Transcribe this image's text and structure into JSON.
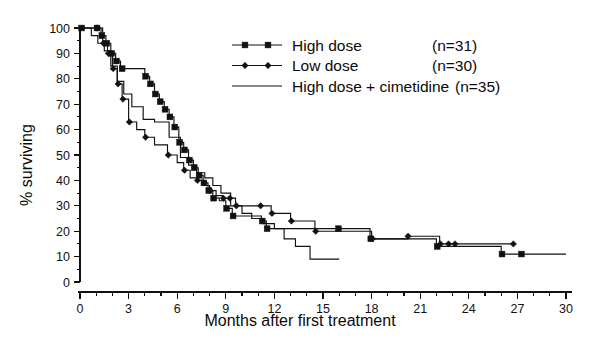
{
  "chart_data": {
    "type": "line",
    "subtype": "kaplan-meier-step",
    "title": "",
    "xlabel": "Months after first treatment",
    "ylabel": "% surviving",
    "xlim": [
      0,
      30
    ],
    "ylim": [
      0,
      100
    ],
    "xticks": [
      0,
      3,
      6,
      9,
      12,
      15,
      18,
      21,
      24,
      27,
      30
    ],
    "xtick_labels": [
      "0",
      "3",
      "6",
      "9",
      "12",
      "15",
      "18",
      "21",
      "24",
      "27",
      "30"
    ],
    "x_minor_tick_step": 1,
    "yticks": [
      0,
      10,
      20,
      30,
      40,
      50,
      60,
      70,
      80,
      90,
      100
    ],
    "ytick_labels": [
      "0",
      "10",
      "20",
      "30",
      "40",
      "50",
      "60",
      "70",
      "80",
      "90",
      "100"
    ],
    "y_minor_tick_step": 5,
    "grid": false,
    "legend_position": "upper-right-inside",
    "series": [
      {
        "name": "High dose",
        "n_label": "(n=31)",
        "n": 31,
        "marker": "square",
        "color": "#111111",
        "x": [
          0,
          1.0,
          1.3,
          1.6,
          1.9,
          2.2,
          2.5,
          4.0,
          4.3,
          4.6,
          4.9,
          5.2,
          5.5,
          5.8,
          6.1,
          6.4,
          6.7,
          7.0,
          7.3,
          7.6,
          7.9,
          8.2,
          8.6,
          9.0,
          9.4,
          10.1,
          11.2,
          11.5,
          12.3,
          13.0,
          15.9,
          17.9,
          22.0,
          22.4,
          26.0,
          27.2,
          30.0
        ],
        "y": [
          100,
          100,
          97,
          94,
          90,
          87,
          84,
          81,
          78,
          74,
          71,
          68,
          65,
          61,
          55,
          52,
          48,
          45,
          42,
          39,
          36,
          33,
          32,
          29,
          26,
          26,
          24,
          21,
          21,
          21,
          21,
          17,
          14,
          14,
          11,
          11,
          11
        ]
      },
      {
        "name": "Low dose",
        "n_label": "(n=30)",
        "n": 30,
        "marker": "diamond",
        "color": "#111111",
        "x": [
          0,
          1.0,
          1.4,
          1.7,
          2.0,
          2.3,
          2.6,
          3.0,
          3.5,
          4.0,
          4.6,
          5.4,
          6.0,
          6.4,
          6.8,
          7.2,
          7.6,
          8.0,
          8.4,
          8.8,
          9.2,
          9.6,
          10.4,
          11.1,
          11.8,
          12.6,
          13.0,
          14.5,
          18.0,
          20.2,
          22.2,
          22.8,
          23.1,
          26.7
        ],
        "y": [
          100,
          100,
          94,
          90,
          84,
          78,
          72,
          63,
          60,
          57,
          54,
          50,
          47,
          44,
          41,
          40,
          38,
          36,
          34,
          33,
          33,
          30,
          30,
          30,
          27,
          27,
          24,
          20,
          17,
          18,
          15,
          15,
          15,
          15
        ]
      },
      {
        "name": "High dose + cimetidine",
        "n_label": "(n=35)",
        "n": 35,
        "marker": "none",
        "color": "#111111",
        "x": [
          0,
          0.7,
          1.1,
          1.5,
          1.9,
          2.3,
          2.7,
          3.2,
          3.9,
          4.6,
          5.5,
          6.2,
          6.7,
          7.2,
          7.7,
          8.2,
          8.7,
          9.3,
          10.0,
          10.6,
          11.3,
          12.0,
          12.6,
          13.3,
          14.2,
          16.0
        ],
        "y": [
          100,
          97,
          94,
          91,
          85,
          79,
          74,
          69,
          64,
          63,
          57,
          49,
          46,
          43,
          41,
          38,
          35,
          30,
          27,
          25,
          23,
          21,
          17,
          14,
          9,
          9
        ]
      }
    ],
    "markers": {
      "High dose": [
        {
          "x": 0.1,
          "y": 100
        },
        {
          "x": 1.05,
          "y": 100
        },
        {
          "x": 1.35,
          "y": 97
        },
        {
          "x": 1.65,
          "y": 94
        },
        {
          "x": 1.95,
          "y": 90
        },
        {
          "x": 2.25,
          "y": 87
        },
        {
          "x": 2.6,
          "y": 84
        },
        {
          "x": 4.05,
          "y": 81
        },
        {
          "x": 4.35,
          "y": 78
        },
        {
          "x": 4.65,
          "y": 74
        },
        {
          "x": 4.95,
          "y": 71
        },
        {
          "x": 5.25,
          "y": 68
        },
        {
          "x": 5.55,
          "y": 65
        },
        {
          "x": 5.85,
          "y": 61
        },
        {
          "x": 6.15,
          "y": 55
        },
        {
          "x": 6.45,
          "y": 52
        },
        {
          "x": 6.75,
          "y": 48
        },
        {
          "x": 7.05,
          "y": 45
        },
        {
          "x": 7.35,
          "y": 42
        },
        {
          "x": 7.65,
          "y": 39
        },
        {
          "x": 7.95,
          "y": 36
        },
        {
          "x": 8.25,
          "y": 33
        },
        {
          "x": 9.05,
          "y": 29
        },
        {
          "x": 9.45,
          "y": 26
        },
        {
          "x": 11.25,
          "y": 24
        },
        {
          "x": 11.55,
          "y": 21
        },
        {
          "x": 15.95,
          "y": 21
        },
        {
          "x": 17.95,
          "y": 17
        },
        {
          "x": 22.05,
          "y": 14
        },
        {
          "x": 26.05,
          "y": 11
        },
        {
          "x": 27.25,
          "y": 11
        }
      ],
      "Low dose": [
        {
          "x": 1.05,
          "y": 100
        },
        {
          "x": 1.45,
          "y": 94
        },
        {
          "x": 1.75,
          "y": 90
        },
        {
          "x": 2.05,
          "y": 84
        },
        {
          "x": 2.35,
          "y": 78
        },
        {
          "x": 2.65,
          "y": 72
        },
        {
          "x": 3.05,
          "y": 63
        },
        {
          "x": 4.05,
          "y": 57
        },
        {
          "x": 5.45,
          "y": 50
        },
        {
          "x": 6.45,
          "y": 44
        },
        {
          "x": 7.25,
          "y": 40
        },
        {
          "x": 8.05,
          "y": 36
        },
        {
          "x": 8.85,
          "y": 33
        },
        {
          "x": 9.25,
          "y": 33
        },
        {
          "x": 9.65,
          "y": 30
        },
        {
          "x": 11.15,
          "y": 30
        },
        {
          "x": 11.85,
          "y": 27
        },
        {
          "x": 13.05,
          "y": 24
        },
        {
          "x": 14.55,
          "y": 20
        },
        {
          "x": 18.05,
          "y": 17
        },
        {
          "x": 20.25,
          "y": 18
        },
        {
          "x": 22.25,
          "y": 15
        },
        {
          "x": 22.75,
          "y": 15
        },
        {
          "x": 23.15,
          "y": 15
        },
        {
          "x": 26.75,
          "y": 15
        }
      ]
    }
  },
  "legend": {
    "items": [
      {
        "label": "High dose",
        "n": "(n=31)",
        "marker": "square"
      },
      {
        "label": "Low dose",
        "n": "(n=30)",
        "marker": "diamond"
      },
      {
        "label": "High dose + cimetidine",
        "n": "(n=35)",
        "marker": "line"
      }
    ]
  },
  "axes": {
    "x_title": "Months after first treatment",
    "y_title": "% surviving"
  }
}
